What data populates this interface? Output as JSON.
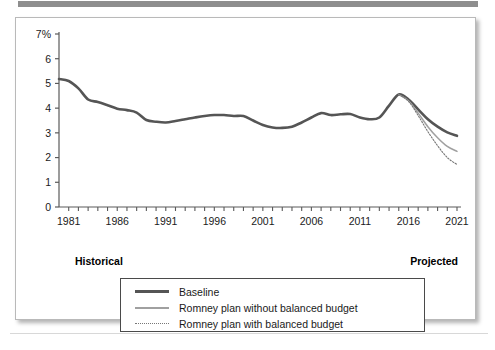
{
  "figure": {
    "panel_bg": "#ffffff",
    "top_band_color": "#8e8e8e"
  },
  "axes": {
    "y_ticks": [
      "7%",
      "6",
      "5",
      "4",
      "3",
      "2",
      "1",
      "0"
    ],
    "y_values": [
      7,
      6,
      5,
      4,
      3,
      2,
      1,
      0
    ],
    "x_ticks": [
      "1981",
      "1986",
      "1991",
      "1996",
      "2001",
      "2006",
      "2011",
      "2016",
      "2021"
    ],
    "x_tick_values": [
      1981,
      1986,
      1991,
      1996,
      2001,
      2006,
      2011,
      2016,
      2021
    ]
  },
  "annotations": {
    "historical": "Historical",
    "projected": "Projected"
  },
  "legend": {
    "items": [
      {
        "label": "Baseline",
        "color": "#555555",
        "style": "solid-thick"
      },
      {
        "label": "Romney plan without balanced budget",
        "color": "#a0a0a0",
        "style": "solid-thin"
      },
      {
        "label": "Romney plan with balanced budget",
        "color": "#777777",
        "style": "dotted"
      }
    ]
  },
  "chart_data": {
    "type": "line",
    "title": "",
    "subtitle": "",
    "xlabel": "",
    "ylabel": "",
    "ylim": [
      0,
      7
    ],
    "xlim": [
      1980,
      2021
    ],
    "grid": false,
    "legend_position": "bottom",
    "y_unit": "percent",
    "x": [
      1980,
      1981,
      1982,
      1983,
      1984,
      1985,
      1986,
      1987,
      1988,
      1989,
      1990,
      1991,
      1992,
      1993,
      1994,
      1995,
      1996,
      1997,
      1998,
      1999,
      2000,
      2001,
      2002,
      2003,
      2004,
      2005,
      2006,
      2007,
      2008,
      2009,
      2010,
      2011,
      2012,
      2013,
      2014,
      2015,
      2016,
      2017,
      2018,
      2019,
      2020,
      2021
    ],
    "series": [
      {
        "name": "Baseline",
        "color": "#555555",
        "style": "solid-thick",
        "values": [
          5.18,
          5.1,
          4.8,
          4.35,
          4.25,
          4.12,
          3.98,
          3.92,
          3.82,
          3.52,
          3.45,
          3.42,
          3.48,
          3.55,
          3.62,
          3.68,
          3.72,
          3.72,
          3.68,
          3.68,
          3.5,
          3.32,
          3.22,
          3.2,
          3.25,
          3.42,
          3.62,
          3.8,
          3.72,
          3.75,
          3.76,
          3.62,
          3.55,
          3.62,
          4.1,
          4.55,
          4.35,
          3.95,
          3.55,
          3.25,
          3.02,
          2.88
        ]
      },
      {
        "name": "Romney plan without balanced budget",
        "color": "#a0a0a0",
        "style": "solid-thin",
        "values": [
          null,
          null,
          null,
          null,
          null,
          null,
          null,
          null,
          null,
          null,
          null,
          null,
          null,
          null,
          null,
          null,
          null,
          null,
          null,
          null,
          null,
          null,
          null,
          null,
          null,
          null,
          null,
          null,
          null,
          null,
          null,
          null,
          null,
          null,
          null,
          4.55,
          4.3,
          3.8,
          3.25,
          2.8,
          2.45,
          2.25
        ]
      },
      {
        "name": "Romney plan with balanced budget",
        "color": "#777777",
        "style": "dotted",
        "values": [
          null,
          null,
          null,
          null,
          null,
          null,
          null,
          null,
          null,
          null,
          null,
          null,
          null,
          null,
          null,
          null,
          null,
          null,
          null,
          null,
          null,
          null,
          null,
          null,
          null,
          null,
          null,
          null,
          null,
          null,
          null,
          null,
          null,
          null,
          null,
          4.55,
          4.28,
          3.7,
          3.05,
          2.48,
          2.0,
          1.72
        ]
      }
    ],
    "endpoint_values": {
      "baseline_2021": 2.55,
      "romney_without_balanced_budget_2021": 1.65,
      "romney_with_balanced_budget_2021": 1.15
    },
    "notes": [
      "Historical",
      "Projected"
    ]
  }
}
